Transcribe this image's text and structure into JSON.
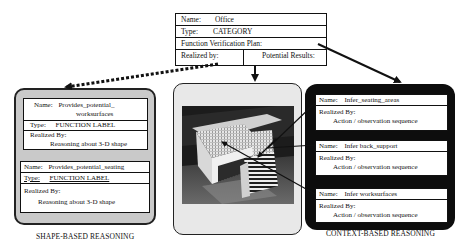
{
  "category_frame": {
    "name_label": "Name:",
    "name_value": "Office",
    "type_label": "Type:",
    "type_value": "CATEGORY",
    "plan_label": "Function Verification Plan:",
    "realized_label": "Realized by:",
    "results_label": "Potential Results:"
  },
  "shape_panel": {
    "caption": "SHAPE-BASED REASONING",
    "frames": [
      {
        "name_label": "Name:",
        "name_value": "Provides_potential_",
        "name_value_cont": "worksurfaces",
        "type_label": "Type:",
        "type_value": "FUNCTION LABEL",
        "realized_label": "Realized By:",
        "realized_value": "Reasoning about 3-D shape"
      },
      {
        "name_label": "Name:",
        "name_value": "Provides_potential_seating",
        "type_label": "Type:",
        "type_value": "FUNCTION LABEL",
        "realized_label": "Realized By:",
        "realized_value": "Reasoning about 3-D shape"
      }
    ]
  },
  "image_panel": {
    "description": "Photo of office scene: table and chair"
  },
  "context_panel": {
    "caption": "CONTEXT-BASED REASONING",
    "frames": [
      {
        "name_label": "Name:",
        "name_value": "Infer_seating_areas",
        "realized_label": "Realized By:",
        "realized_value": "Action / observation sequence"
      },
      {
        "name_label": "Name:",
        "name_value": "Infer back_support",
        "realized_label": "Realized By:",
        "realized_value": "Action / observation sequence"
      },
      {
        "name_label": "Name:",
        "name_value": "Infer worksurfaces",
        "realized_label": "Realized By:",
        "realized_value": "Action / observation sequence"
      }
    ]
  },
  "colors": {
    "line": "#111111",
    "context_panel_bg": "#0d0d0d",
    "shape_panel_bg": "#c9c9c9",
    "image_panel_bg": "#e8e8e8"
  }
}
